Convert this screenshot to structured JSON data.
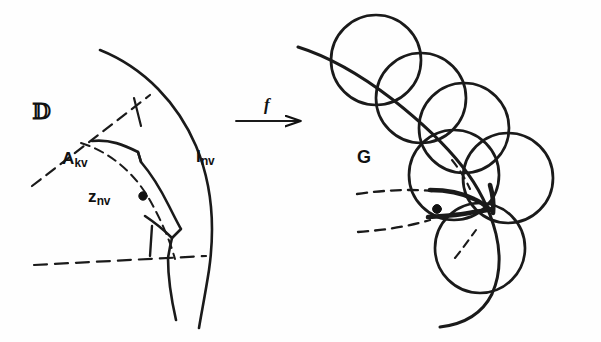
{
  "figure": {
    "kind": "mathematical-diagram",
    "background_color": "#fefefe",
    "ink_color": "#111111"
  },
  "left_panel": {
    "name": "domain-panel",
    "labels": {
      "domain": "𝔻",
      "cell": {
        "base": "A",
        "sub": "kv"
      },
      "point": {
        "base": "z",
        "sub": "nv"
      },
      "interval": {
        "base": "I",
        "sub": "nv"
      }
    }
  },
  "map": {
    "name": "map-arrow",
    "label": "f",
    "direction": "left-to-right"
  },
  "right_panel": {
    "name": "image-panel",
    "labels": {
      "region": "G"
    },
    "circle_count": 6
  },
  "geometry": {
    "boundary_arc": "solid circular arc (unit circle of D)",
    "inner_arc": "dashed circular arc",
    "rays": "two dashed radial rays bounding the sector",
    "marked_point_left": {
      "x": 143,
      "y": 196
    },
    "marked_point_right": {
      "x": 437,
      "y": 209
    },
    "circles": [
      {
        "cx": 376,
        "cy": 60,
        "r": 45
      },
      {
        "cx": 421,
        "cy": 98,
        "r": 45
      },
      {
        "cx": 464,
        "cy": 128,
        "r": 45
      },
      {
        "cx": 454,
        "cy": 175,
        "r": 45
      },
      {
        "cx": 508,
        "cy": 178,
        "r": 45
      },
      {
        "cx": 480,
        "cy": 248,
        "r": 45
      }
    ]
  }
}
